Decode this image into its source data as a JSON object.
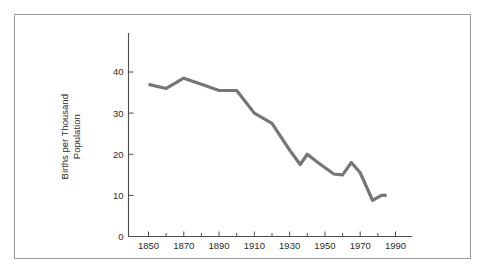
{
  "figure": {
    "border_color": "#9a9a9a",
    "background": "#ffffff"
  },
  "chart_data": {
    "type": "line",
    "title": "",
    "subtitle": "",
    "xlabel": "",
    "ylabel": "Births per Thousand Population",
    "ylabel_line1": "Births per Thousand",
    "ylabel_line2": "Population",
    "xlim": [
      1840,
      2000
    ],
    "ylim": [
      0,
      48
    ],
    "grid": false,
    "legend": false,
    "legend_position": "none",
    "line_color": "#767676",
    "line_width": 3.2,
    "axis_color": "#4d4d4d",
    "x_major_ticks": [
      1850,
      1870,
      1890,
      1910,
      1930,
      1950,
      1970,
      1990
    ],
    "x_major_tick_labels": [
      "1850",
      "1870",
      "1890",
      "1910",
      "1930",
      "1950",
      "1970",
      "1990"
    ],
    "x_minor_ticks": [
      1860,
      1880,
      1900,
      1920,
      1940,
      1960,
      1980
    ],
    "y_ticks": [
      0,
      10,
      20,
      30,
      40
    ],
    "y_tick_labels": [
      "0",
      "10",
      "20",
      "30",
      "40"
    ],
    "series": [
      {
        "name": "Births per Thousand Population",
        "x": [
          1850,
          1860,
          1870,
          1880,
          1890,
          1900,
          1910,
          1920,
          1930,
          1936,
          1940,
          1946,
          1955,
          1960,
          1965,
          1970,
          1977,
          1982,
          1985
        ],
        "values": [
          37.0,
          36.0,
          38.5,
          37.0,
          35.5,
          35.5,
          30.0,
          27.5,
          21.0,
          17.5,
          20.0,
          18.0,
          15.2,
          15.0,
          18.0,
          15.5,
          8.8,
          10.0,
          10.0
        ]
      }
    ]
  }
}
